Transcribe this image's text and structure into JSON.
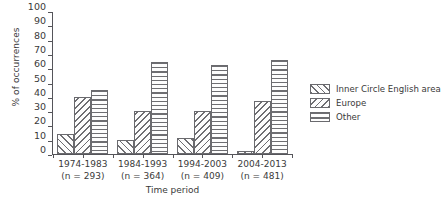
{
  "chart_data": {
    "type": "bar",
    "title": "",
    "xlabel": "Time period",
    "ylabel": "% of occurrences",
    "ylim": [
      0,
      100
    ],
    "yticks": [
      0,
      10,
      20,
      30,
      40,
      50,
      60,
      70,
      80,
      90,
      100
    ],
    "grid": false,
    "legend_position": "right",
    "categories": [
      "1974-1983",
      "1984-1993",
      "1994-2003",
      "2004-2013"
    ],
    "category_sublabels": [
      "(n = 293)",
      "(n = 364)",
      "(n = 409)",
      "(n = 481)"
    ],
    "series": [
      {
        "name": "Inner Circle English area",
        "pattern": "forward-diagonal-hatch",
        "values": [
          14,
          10,
          11,
          2
        ]
      },
      {
        "name": "Europe",
        "pattern": "backward-diagonal-hatch",
        "values": [
          40,
          30,
          30,
          37
        ]
      },
      {
        "name": "Other",
        "pattern": "horizontal-line-hatch",
        "values": [
          45,
          65,
          63,
          66
        ]
      }
    ],
    "colors": {
      "hatch": "#6e6e72",
      "bar_edge": "#6a6a6e",
      "axis": "#55555a",
      "text": "#3a3a3a",
      "background": "#ffffff"
    }
  },
  "axis": {
    "y_tick_labels": [
      "100",
      "90",
      "80",
      "70",
      "60",
      "50",
      "40",
      "30",
      "20",
      "10",
      "0"
    ],
    "y_title": "% of occurrences",
    "x_title": "Time period"
  },
  "legend": {
    "items": [
      {
        "label": "Inner Circle English area"
      },
      {
        "label": "Europe"
      },
      {
        "label": "Other"
      }
    ]
  }
}
